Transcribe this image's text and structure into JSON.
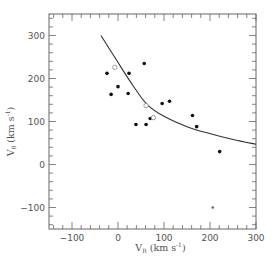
{
  "chart_data": {
    "type": "scatter",
    "title": "",
    "xlabel": "V_R (km s^-1)",
    "ylabel": "V_θ (km s^-1)",
    "xlabel_parts": {
      "main": "V",
      "sub": "R",
      "unit": "(km s",
      "sup": "-1",
      "close": ")"
    },
    "ylabel_parts": {
      "main": "V",
      "sub": "θ",
      "unit": "(km s",
      "sup": "-1",
      "close": ")"
    },
    "xlim": [
      -150,
      300
    ],
    "ylim": [
      -150,
      350
    ],
    "xticks": [
      -100,
      0,
      100,
      200,
      300
    ],
    "yticks": [
      -100,
      0,
      100,
      200,
      300
    ],
    "xtick_labels": [
      "-100",
      "0",
      "100",
      "200",
      "300"
    ],
    "ytick_labels": [
      "-100",
      "0",
      "100",
      "200",
      "300"
    ],
    "grid": false,
    "legend": "none",
    "series": [
      {
        "name": "filled",
        "marker": "filled-circle",
        "color": "#111111",
        "points": [
          [
            -24,
            212
          ],
          [
            -15,
            163
          ],
          [
            0,
            181
          ],
          [
            24,
            212
          ],
          [
            22,
            165
          ],
          [
            57,
            235
          ],
          [
            39,
            93
          ],
          [
            61,
            93
          ],
          [
            70,
            107
          ],
          [
            96,
            142
          ],
          [
            112,
            147
          ],
          [
            162,
            114
          ],
          [
            171,
            88
          ],
          [
            221,
            30
          ]
        ]
      },
      {
        "name": "open",
        "marker": "open-circle",
        "color": "#888888",
        "points": [
          [
            -7,
            226
          ],
          [
            61,
            137
          ],
          [
            77,
            109
          ]
        ]
      },
      {
        "name": "small-gray",
        "marker": "small-dot",
        "color": "#666666",
        "points": [
          [
            206,
            -100
          ]
        ]
      }
    ],
    "curve": {
      "name": "model-curve",
      "color": "#333333",
      "points": [
        [
          -37,
          300
        ],
        [
          -4,
          244
        ],
        [
          31,
          186
        ],
        [
          63,
          140
        ],
        [
          100,
          112
        ],
        [
          150,
          88
        ],
        [
          199,
          72
        ],
        [
          250,
          58
        ],
        [
          300,
          47
        ]
      ]
    }
  }
}
